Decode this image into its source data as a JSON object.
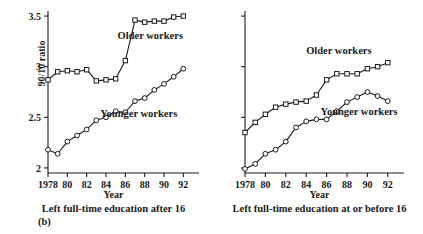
{
  "figure": {
    "label": "(b)",
    "ylabel": "90/10 ratio",
    "xlabel": "Year"
  },
  "chart_data": [
    {
      "type": "line",
      "panel": "left",
      "title": "",
      "caption": "Left full-time education after 16",
      "xlabel": "Year",
      "ylabel": "90/10 ratio",
      "xlim": [
        1978,
        1993
      ],
      "ylim": [
        1.95,
        3.55
      ],
      "xticks": [
        1978,
        1980,
        1982,
        1984,
        1986,
        1988,
        1990,
        1992
      ],
      "xtick_labels": [
        "1978",
        "80",
        "82",
        "84",
        "86",
        "88",
        "90",
        "92"
      ],
      "yticks": [
        2,
        2.5,
        3,
        3.5
      ],
      "ytick_labels": [
        "2",
        "2.5",
        "3",
        "3.5"
      ],
      "grid": false,
      "legend_position": "inline-annotation",
      "x": [
        1978,
        1979,
        1980,
        1981,
        1982,
        1983,
        1984,
        1985,
        1986,
        1987,
        1988,
        1989,
        1990,
        1991,
        1992
      ],
      "series": [
        {
          "name": "Older workers",
          "marker": "square",
          "values": [
            2.87,
            2.95,
            2.96,
            2.95,
            2.97,
            2.86,
            2.87,
            2.88,
            3.06,
            3.46,
            3.44,
            3.45,
            3.45,
            3.49,
            3.5
          ]
        },
        {
          "name": "Younger workers",
          "marker": "circle",
          "values": [
            2.18,
            2.14,
            2.26,
            2.32,
            2.38,
            2.47,
            2.5,
            2.56,
            2.55,
            2.66,
            2.69,
            2.77,
            2.83,
            2.9,
            2.98
          ]
        }
      ],
      "annotations": [
        {
          "text": "Older workers",
          "x": 1985.2,
          "y": 3.27
        },
        {
          "text": "Younger workers",
          "x": 1983.4,
          "y": 2.5
        }
      ]
    },
    {
      "type": "line",
      "panel": "right",
      "title": "",
      "caption": "Left full-time education at or before 16",
      "xlabel": "Year",
      "ylabel": "90/10 ratio",
      "xlim": [
        1978,
        1993
      ],
      "ylim": [
        1.95,
        3.55
      ],
      "xticks": [
        1978,
        1980,
        1982,
        1984,
        1986,
        1988,
        1990,
        1992
      ],
      "xtick_labels": [
        "1978",
        "80",
        "82",
        "84",
        "86",
        "88",
        "90",
        "92"
      ],
      "yticks": [
        2,
        2.5,
        3,
        3.5
      ],
      "ytick_labels": [
        "",
        "",
        "",
        ""
      ],
      "grid": false,
      "legend_position": "inline-annotation",
      "x": [
        1978,
        1979,
        1980,
        1981,
        1982,
        1983,
        1984,
        1985,
        1986,
        1987,
        1988,
        1989,
        1990,
        1991,
        1992
      ],
      "series": [
        {
          "name": "Older workers",
          "marker": "square",
          "values": [
            2.35,
            2.45,
            2.53,
            2.6,
            2.63,
            2.65,
            2.66,
            2.72,
            2.87,
            2.93,
            2.93,
            2.93,
            2.98,
            3.0,
            3.04
          ]
        },
        {
          "name": "Younger workers",
          "marker": "circle",
          "values": [
            1.99,
            2.04,
            2.14,
            2.18,
            2.26,
            2.4,
            2.46,
            2.48,
            2.48,
            2.56,
            2.65,
            2.7,
            2.75,
            2.71,
            2.66
          ]
        }
      ],
      "annotations": [
        {
          "text": "Older workers",
          "x": 1984.0,
          "y": 3.13
        },
        {
          "text": "Younger workers",
          "x": 1985.4,
          "y": 2.52
        }
      ]
    }
  ]
}
